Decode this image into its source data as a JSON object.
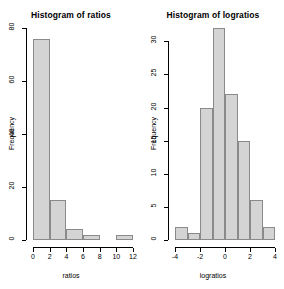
{
  "chart_data": [
    {
      "type": "bar",
      "name": "histogram-ratios",
      "title": "Histogram of ratios",
      "xlabel": "ratios",
      "ylabel": "Frequency",
      "xlim": [
        0,
        12
      ],
      "ylim": [
        0,
        80
      ],
      "xticks": [
        "0",
        "2",
        "4",
        "6",
        "8",
        "10",
        "12"
      ],
      "xtick_values": [
        0,
        2,
        4,
        6,
        8,
        10,
        12
      ],
      "yticks": [
        "0",
        "20",
        "40",
        "60",
        "80"
      ],
      "ytick_values": [
        0,
        20,
        40,
        60,
        80
      ],
      "grid": false,
      "legend": "none",
      "bin_edges": [
        0,
        2,
        4,
        6,
        8,
        10,
        12
      ],
      "categories": [
        "0-2",
        "2-4",
        "4-6",
        "6-8",
        "8-10",
        "10-12"
      ],
      "values": [
        76,
        15,
        4,
        2,
        0,
        2
      ],
      "bar_fill": "#d4d4d4",
      "bar_border": "#8a8a8a"
    },
    {
      "type": "bar",
      "name": "histogram-logratios",
      "title": "Histogram of logratios",
      "xlabel": "logratios",
      "ylabel": "Frequency",
      "xlim": [
        -4,
        4
      ],
      "ylim": [
        0,
        32
      ],
      "xticks": [
        "-4",
        "-2",
        "0",
        "2",
        "4"
      ],
      "xtick_values": [
        -4,
        -2,
        0,
        2,
        4
      ],
      "yticks": [
        "0",
        "5",
        "10",
        "15",
        "20",
        "25",
        "30"
      ],
      "ytick_values": [
        0,
        5,
        10,
        15,
        20,
        25,
        30
      ],
      "grid": false,
      "legend": "none",
      "bin_edges": [
        -4,
        -3,
        -2,
        -1,
        0,
        1,
        2,
        3,
        4
      ],
      "categories": [
        "-4--3",
        "-3--2",
        "-2--1",
        "-1-0",
        "0-1",
        "1-2",
        "2-3",
        "3-4"
      ],
      "values": [
        2,
        1,
        20,
        32,
        22,
        15,
        6,
        2
      ],
      "bar_fill": "#d4d4d4",
      "bar_border": "#8a8a8a"
    }
  ]
}
